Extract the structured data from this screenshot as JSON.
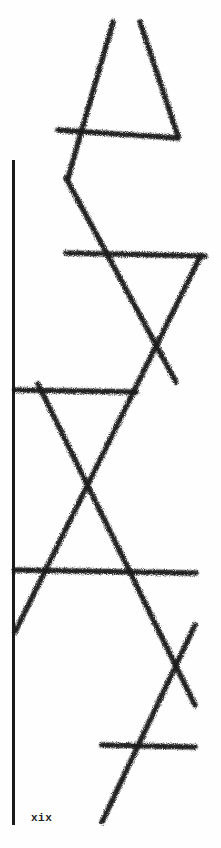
{
  "page": {
    "folio": "xix",
    "ink_color": "#1c1c1c",
    "background": "#fefefe"
  },
  "artwork": {
    "description": "hand-drawn crayon strokes forming interlocking triangles",
    "strokes": [
      {
        "x1": 113,
        "y1": 22,
        "x2": 68,
        "y2": 178
      },
      {
        "x1": 140,
        "y1": 22,
        "x2": 178,
        "y2": 136
      },
      {
        "x1": 58,
        "y1": 130,
        "x2": 178,
        "y2": 138
      },
      {
        "x1": 66,
        "y1": 178,
        "x2": 176,
        "y2": 382
      },
      {
        "x1": 66,
        "y1": 253,
        "x2": 205,
        "y2": 256
      },
      {
        "x1": 200,
        "y1": 257,
        "x2": 15,
        "y2": 632
      },
      {
        "x1": 15,
        "y1": 390,
        "x2": 136,
        "y2": 392
      },
      {
        "x1": 38,
        "y1": 384,
        "x2": 195,
        "y2": 705
      },
      {
        "x1": 15,
        "y1": 570,
        "x2": 196,
        "y2": 573
      },
      {
        "x1": 195,
        "y1": 625,
        "x2": 102,
        "y2": 822
      },
      {
        "x1": 102,
        "y1": 745,
        "x2": 195,
        "y2": 747
      }
    ]
  }
}
